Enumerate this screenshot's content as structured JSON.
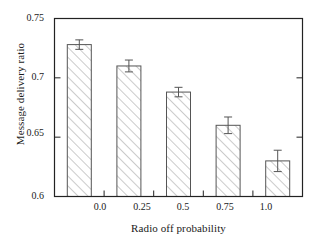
{
  "chart_data": {
    "type": "bar",
    "title": "",
    "xlabel": "Radio off probability",
    "ylabel": "Message delivery ratio",
    "categories": [
      "0.0",
      "0.25",
      "0.5",
      "0.75",
      "1.0"
    ],
    "values": [
      0.728,
      0.71,
      0.688,
      0.66,
      0.63
    ],
    "errors": [
      0.004,
      0.005,
      0.004,
      0.007,
      0.009
    ],
    "ylim": [
      0.6,
      0.75
    ],
    "yticks": [
      "0.6",
      "0.65",
      "0.7",
      "0.75"
    ],
    "ytick_values": [
      0.6,
      0.65,
      0.7,
      0.75
    ],
    "xticks": [
      "0.0",
      "0.25",
      "0.5",
      "0.75",
      "1.0"
    ],
    "grid": false,
    "legend": "none",
    "bar_fill": "#ffffff",
    "bar_edge": "#555555",
    "hatch": "forward-diagonal",
    "error_bar_color": "#555555",
    "frame_color": "#222222"
  }
}
